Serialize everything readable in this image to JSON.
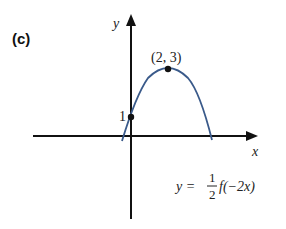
{
  "panel_label": "(c)",
  "axes": {
    "x_label": "x",
    "y_label": "y"
  },
  "points": [
    {
      "label": "(2, 3)",
      "x": 2,
      "y": 3,
      "type": "maximum"
    },
    {
      "label": "1",
      "x": 0,
      "y": 1,
      "type": "y-intercept"
    }
  ],
  "equation": {
    "lhs": "y =",
    "numerator": "1",
    "denominator": "2",
    "func": "f(−2x)",
    "full": "y = 1/2 f(−2x)"
  },
  "colors": {
    "curve": "#3a5a8a",
    "axes": "#111111"
  }
}
